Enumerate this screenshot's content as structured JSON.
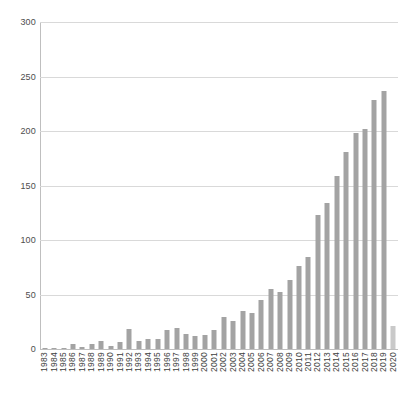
{
  "chart_data": {
    "type": "bar",
    "title": "",
    "xlabel": "",
    "ylabel": "",
    "ylim": [
      0,
      300
    ],
    "yticks": [
      0,
      50,
      100,
      150,
      200,
      250,
      300
    ],
    "grid": true,
    "legend": "none",
    "bar_color": "#a3a3a3",
    "highlight_color": "#c9c9c9",
    "highlight_categories": [
      "2020"
    ],
    "categories": [
      "1983",
      "1984",
      "1985",
      "1986",
      "1987",
      "1988",
      "1989",
      "1990",
      "1991",
      "1992",
      "1993",
      "1994",
      "1995",
      "1996",
      "1997",
      "1998",
      "1999",
      "2000",
      "2001",
      "2002",
      "2003",
      "2004",
      "2005",
      "2006",
      "2007",
      "2008",
      "2009",
      "2010",
      "2011",
      "2012",
      "2013",
      "2014",
      "2015",
      "2016",
      "2017",
      "2018",
      "2019",
      "2020"
    ],
    "values": [
      1,
      1,
      1,
      5,
      2,
      5,
      7,
      3,
      6,
      18,
      7,
      9,
      9,
      17,
      19,
      14,
      12,
      13,
      17,
      29,
      26,
      35,
      33,
      45,
      55,
      52,
      63,
      76,
      84,
      123,
      134,
      159,
      181,
      198,
      202,
      228,
      237,
      21
    ]
  }
}
